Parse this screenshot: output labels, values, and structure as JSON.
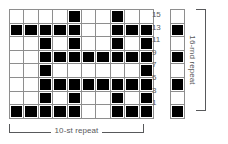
{
  "chart_data": {
    "type": "heatmap",
    "title": "",
    "xlabel": "10-st repeat",
    "ylabel": "16-rnd repeat",
    "columns": 10,
    "rows": 8,
    "row_labels": [
      "15",
      "13",
      "11",
      "9",
      "7",
      "5",
      "3",
      "1"
    ],
    "legend": {
      "filled": "purl / contrast stitch",
      "empty": "knit / background stitch"
    },
    "grid": [
      [
        0,
        0,
        0,
        0,
        1,
        0,
        0,
        1,
        0,
        0
      ],
      [
        1,
        1,
        1,
        1,
        1,
        0,
        0,
        1,
        1,
        1
      ],
      [
        0,
        0,
        1,
        0,
        1,
        0,
        0,
        1,
        0,
        1
      ],
      [
        0,
        0,
        1,
        1,
        1,
        1,
        1,
        1,
        1,
        1
      ],
      [
        0,
        0,
        1,
        0,
        0,
        0,
        0,
        0,
        0,
        1
      ],
      [
        0,
        0,
        1,
        1,
        1,
        1,
        1,
        1,
        1,
        1
      ],
      [
        0,
        0,
        1,
        0,
        1,
        0,
        0,
        1,
        0,
        1
      ],
      [
        1,
        1,
        1,
        1,
        1,
        0,
        0,
        1,
        1,
        1
      ]
    ],
    "side_column": [
      0,
      1,
      0,
      1,
      0,
      1,
      0,
      1
    ],
    "grid_on": true,
    "colors": {
      "filled": "#000000",
      "empty": "#ffffff",
      "cell_border": "#8e8e8e",
      "outer_border": "#000000",
      "label_text": "#58595b"
    }
  },
  "brackets": {
    "horizontal_label": "10-st repeat",
    "vertical_label": "16-rnd repeat"
  }
}
